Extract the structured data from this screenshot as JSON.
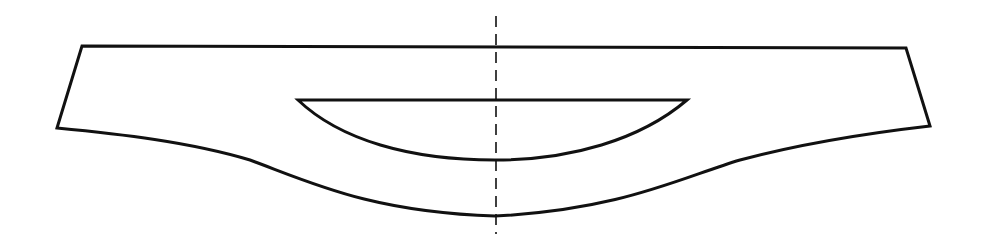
{
  "diagram": {
    "type": "cross-section outline",
    "colors": {
      "background": "#ffffff",
      "line": "#111111"
    },
    "stroke_width": 3,
    "outer_outline": {
      "top_left": [
        82,
        46
      ],
      "top_right": [
        906,
        48
      ],
      "bottom_right": [
        930,
        126
      ],
      "bottom_left": [
        57,
        128
      ],
      "bottom_center": [
        495,
        216
      ],
      "path": "M 82 46 L 906 48 L 930 126 C 860 134, 800 144, 740 160 C 680 178, 620 210, 495 216 C 370 212, 310 182, 250 160 C 190 142, 120 134, 57 128 Z"
    },
    "inner_cavity": {
      "top_left": [
        298,
        100
      ],
      "top_right": [
        687,
        100
      ],
      "bottom_center": [
        495,
        160
      ],
      "path": "M 298 100 L 687 100 C 640 140, 570 160, 495 160 C 410 160, 340 140, 298 100 Z"
    },
    "center_axis": {
      "style": "dashed",
      "x": 496,
      "y_top": 16,
      "y_bottom": 234,
      "dash": "11 7"
    }
  }
}
